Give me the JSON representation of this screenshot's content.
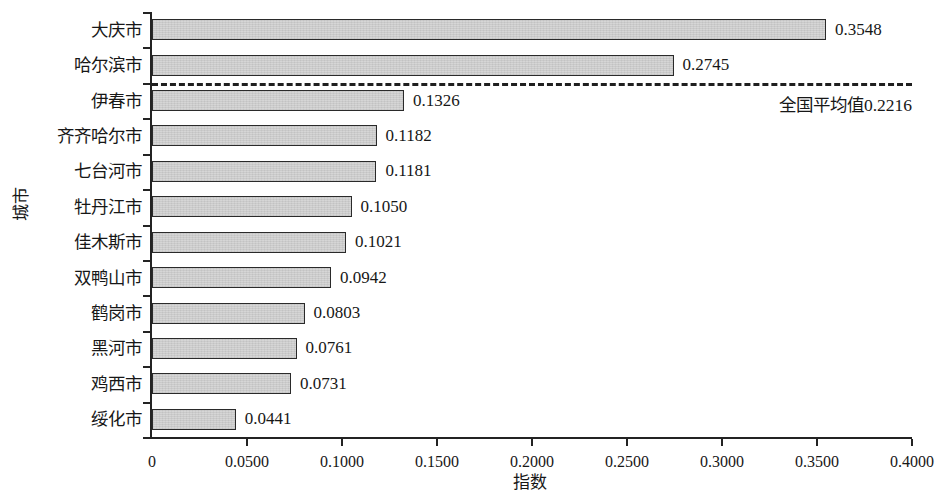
{
  "chart_data": {
    "type": "bar",
    "orientation": "horizontal",
    "title": "",
    "xlabel": "指数",
    "ylabel": "城市",
    "xlim": [
      0,
      0.4
    ],
    "xticks": [
      "0",
      "0.0500",
      "0.1000",
      "0.1500",
      "0.2000",
      "0.2500",
      "0.3000",
      "0.3500",
      "0.4000"
    ],
    "xtick_values": [
      0,
      0.05,
      0.1,
      0.15,
      0.2,
      0.25,
      0.3,
      0.35,
      0.4
    ],
    "grid": false,
    "legend": "none",
    "categories": [
      "大庆市",
      "哈尔滨市",
      "伊春市",
      "齐齐哈尔市",
      "七台河市",
      "牡丹江市",
      "佳木斯市",
      "双鸭山市",
      "鹤岗市",
      "黑河市",
      "鸡西市",
      "绥化市"
    ],
    "values": [
      0.3548,
      0.2745,
      0.1326,
      0.1182,
      0.1181,
      0.105,
      0.1021,
      0.0942,
      0.0803,
      0.0761,
      0.0731,
      0.0441
    ],
    "value_labels": [
      "0.3548",
      "0.2745",
      "0.1326",
      "0.1182",
      "0.1181",
      "0.1050",
      "0.1021",
      "0.0942",
      "0.0803",
      "0.0761",
      "0.0731",
      "0.0441"
    ],
    "reference_line": {
      "value": 0.2216,
      "label": "全国平均值0.2216",
      "style": "dashed",
      "position": "between 哈尔滨市 and 伊春市"
    },
    "bar_fill_color": "#d2d2d2",
    "bar_edge_color": "#2a2a2a",
    "axis_color": "#232323",
    "background_color": "#ffffff"
  }
}
